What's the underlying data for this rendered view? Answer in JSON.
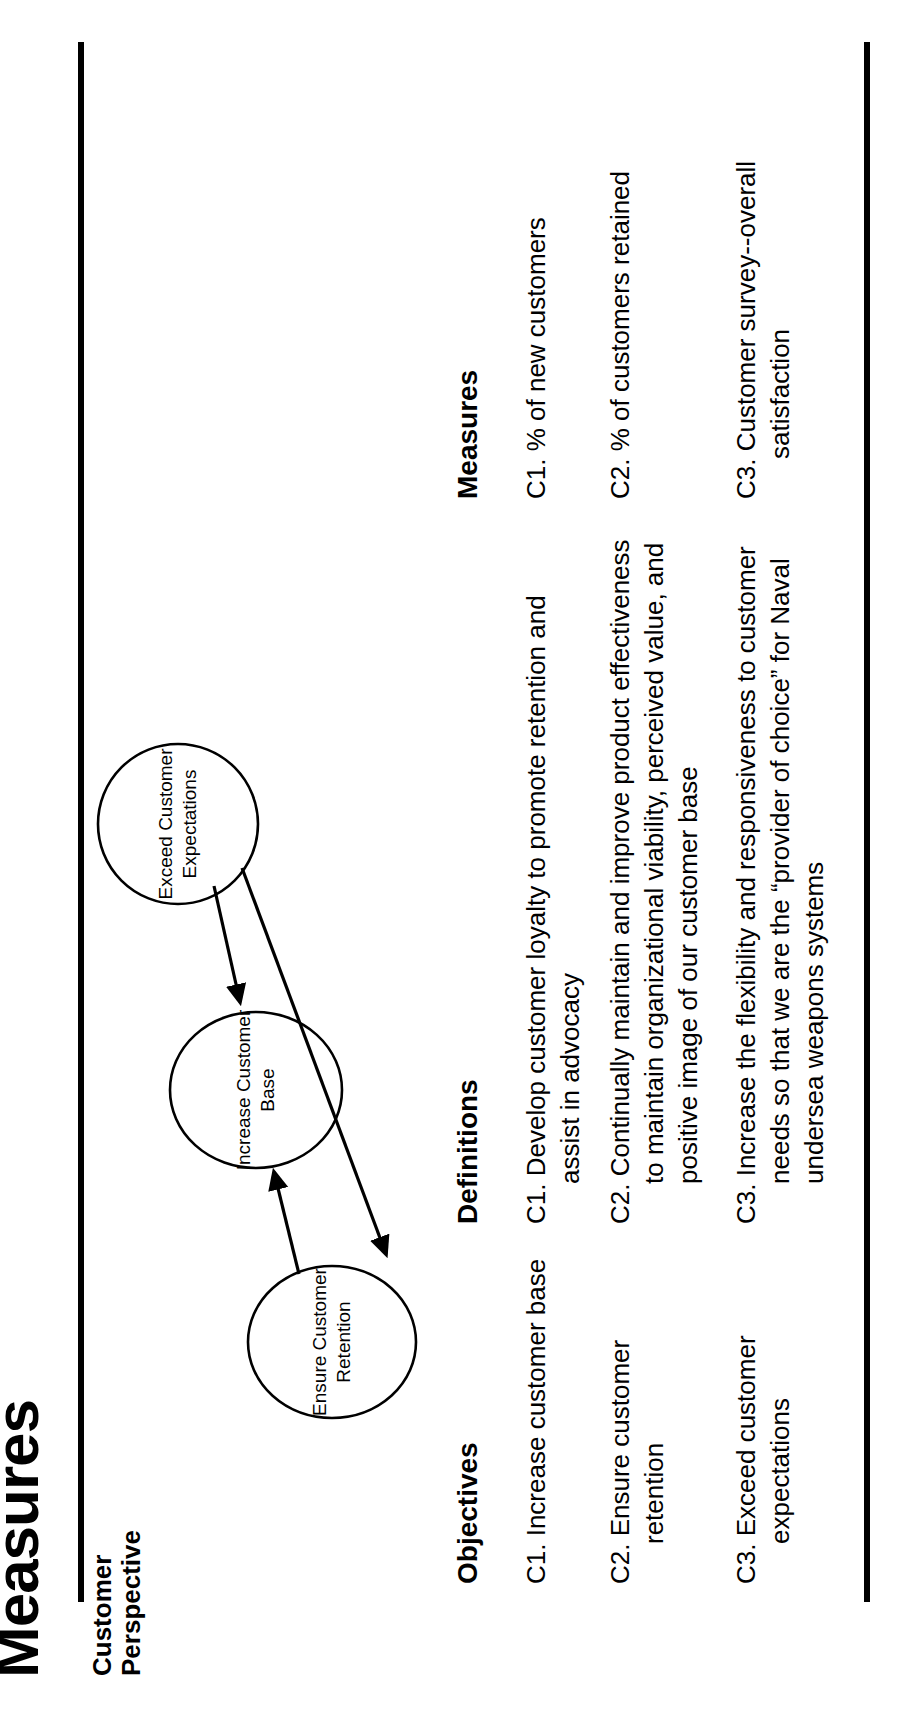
{
  "document": {
    "title": "Measures",
    "perspective_label": "Customer\nPerspective"
  },
  "diagram": {
    "nodes": [
      {
        "id": "ensure-customer-retention",
        "line1": "Ensure Customer",
        "line2": "Retention"
      },
      {
        "id": "increase-customer-base",
        "line1": "Increase Customer",
        "line2": "Base"
      },
      {
        "id": "exceed-customer-expectations",
        "line1": "Exceed Customer",
        "line2": "Expectations"
      }
    ],
    "arrows": [
      {
        "from": "ensure-customer-retention",
        "to": "increase-customer-base"
      },
      {
        "from": "exceed-customer-expectations",
        "to": "increase-customer-base"
      },
      {
        "from": "exceed-customer-expectations",
        "to": "ensure-customer-retention"
      }
    ]
  },
  "table": {
    "headers": {
      "objectives": "Objectives",
      "definitions": "Definitions",
      "measures": "Measures"
    },
    "rows": [
      {
        "objective": "C1. Increase customer base",
        "definition": "C1. Develop customer loyalty to promote retention and assist in advocacy",
        "measure": "C1. % of new customers"
      },
      {
        "objective": "C2. Ensure customer retention",
        "definition": "C2. Continually maintain and improve product effectiveness to maintain organizational viability, perceived value, and positive image of our customer base",
        "measure": "C2. % of customers retained"
      },
      {
        "objective": "C3. Exceed customer expectations",
        "definition": "C3. Increase the flexibility and responsiveness to customer needs so that we are the “provider of choice” for Naval undersea weapons systems",
        "measure": "C3. Customer survey--overall satisfaction"
      }
    ]
  }
}
